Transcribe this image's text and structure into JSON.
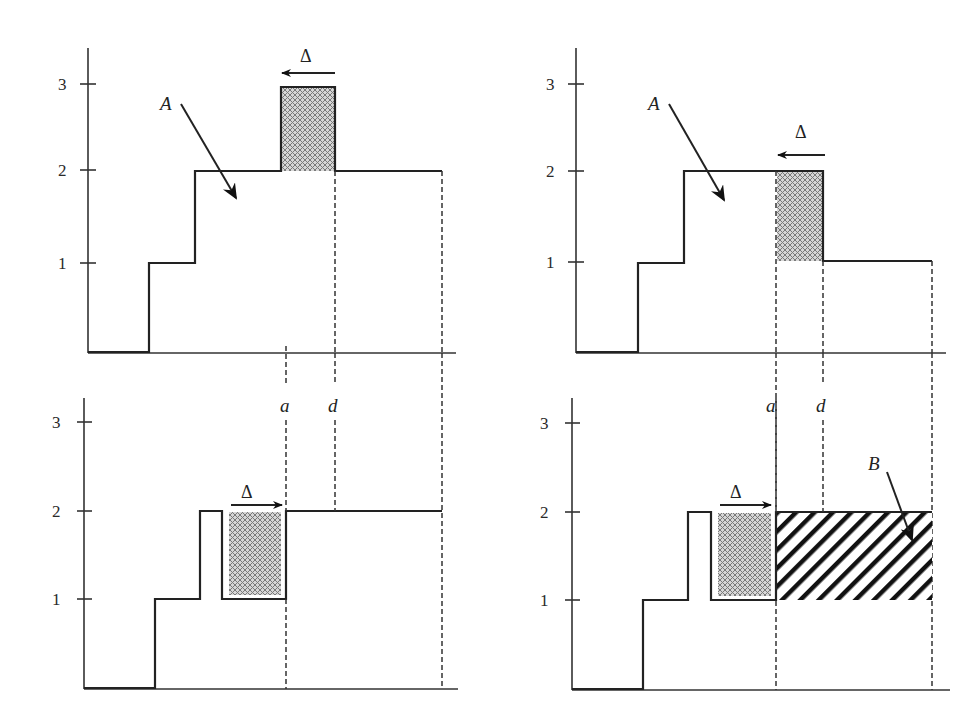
{
  "figure": {
    "y_tick_labels": [
      "1",
      "2",
      "3"
    ],
    "labels": {
      "A": "A",
      "B": "B",
      "delta": "Δ",
      "a": "a",
      "d": "d"
    },
    "panels": [
      {
        "id": "top-left",
        "ticks": [
          "1",
          "2",
          "3"
        ],
        "area_label": "A",
        "shift_label": "Δ",
        "shift_direction": "left",
        "steps": "0 until x1, 1 until x2, 2 until a, 3 until d (crosshatched block), 2 until end"
      },
      {
        "id": "top-right",
        "ticks": [
          "1",
          "2",
          "3"
        ],
        "area_label": "A",
        "shift_label": "Δ",
        "shift_direction": "left",
        "steps": "0, 1, 2 until d with crosshatched block between a and d (levels 1-2), then 1 until end"
      },
      {
        "id": "bottom-left",
        "ticks": [
          "1",
          "2",
          "3"
        ],
        "marker_labels": [
          "a",
          "d"
        ],
        "shift_label": "Δ",
        "shift_direction": "right",
        "steps": "0, 1, 2 (narrow), 1 with crosshatched block before a, then 2 from a to end"
      },
      {
        "id": "bottom-right",
        "ticks": [
          "1",
          "2",
          "3"
        ],
        "marker_labels": [
          "a",
          "d"
        ],
        "area_label": "B",
        "shift_label": "Δ",
        "shift_direction": "right",
        "steps": "0, 1, 2 (narrow), 1 with crosshatched block before a, then 2 from a to end; diagonal-striped region B between levels 1-2 from a to end"
      }
    ],
    "colors": {
      "line": "#222222",
      "crosshatch_fill": "#a8a8a8",
      "stripe": "#111111",
      "background": "#ffffff"
    }
  }
}
